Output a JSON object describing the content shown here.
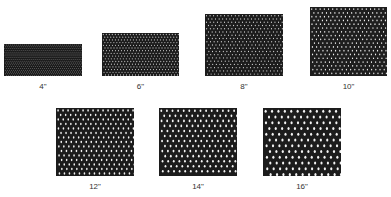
{
  "figure": {
    "swatches": [
      {
        "label": "4\"",
        "size": 4,
        "x": 4,
        "y": 44,
        "w": 78,
        "h": 32,
        "pitch": 2.0,
        "hole": 0.35,
        "ink": "#1a1a1a"
      },
      {
        "label": "6\"",
        "size": 6,
        "x": 102,
        "y": 33,
        "w": 77,
        "h": 43,
        "pitch": 3.0,
        "hole": 0.55,
        "ink": "#1c1c1c"
      },
      {
        "label": "8\"",
        "size": 8,
        "x": 205,
        "y": 14,
        "w": 78,
        "h": 62,
        "pitch": 3.6,
        "hole": 0.6,
        "ink": "#1c1c1c"
      },
      {
        "label": "10\"",
        "size": 10,
        "x": 310,
        "y": 7,
        "w": 77,
        "h": 69,
        "pitch": 4.2,
        "hole": 0.75,
        "ink": "#1e1e1e"
      },
      {
        "label": "12\"",
        "size": 12,
        "x": 56,
        "y": 108,
        "w": 78,
        "h": 68,
        "pitch": 5.0,
        "hole": 1.0,
        "ink": "#1c1c1c"
      },
      {
        "label": "14\"",
        "size": 14,
        "x": 159,
        "y": 108,
        "w": 78,
        "h": 68,
        "pitch": 5.6,
        "hole": 1.15,
        "ink": "#1c1c1c"
      },
      {
        "label": "16\"",
        "size": 16,
        "x": 263,
        "y": 108,
        "w": 78,
        "h": 68,
        "pitch": 6.4,
        "hole": 1.35,
        "ink": "#1c1c1c"
      }
    ],
    "background": "#ffffff"
  }
}
